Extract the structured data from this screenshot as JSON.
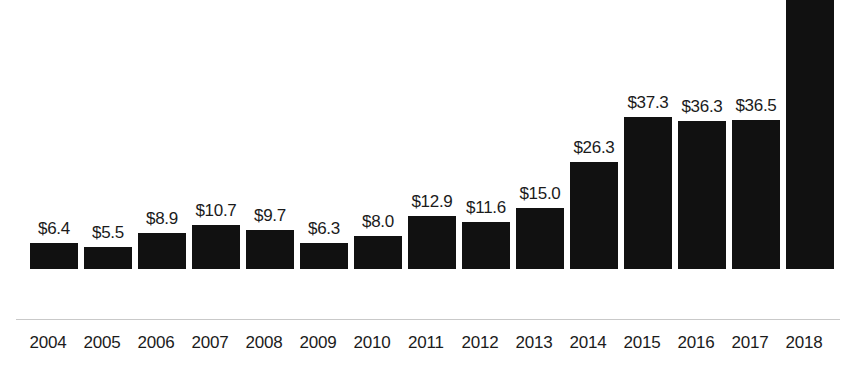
{
  "chart_data": {
    "type": "bar",
    "title": "",
    "subtitle": "",
    "xlabel": "",
    "ylabel": "",
    "categories": [
      "2004",
      "2005",
      "2006",
      "2007",
      "2008",
      "2009",
      "2010",
      "2011",
      "2012",
      "2013",
      "2014",
      "2015",
      "2016",
      "2017",
      "2018"
    ],
    "values": [
      6.4,
      5.5,
      8.9,
      10.7,
      9.7,
      6.3,
      8.0,
      12.9,
      11.6,
      15.0,
      26.3,
      37.3,
      36.3,
      36.5,
      66.8
    ],
    "data_labels": [
      "$6.4",
      "$5.5",
      "$8.9",
      "$10.7",
      "$9.7",
      "$6.3",
      "$8.0",
      "$12.9",
      "$11.6",
      "$15.0",
      "$26.3",
      "$37.3",
      "$36.3",
      "$36.5",
      "$66.8"
    ],
    "value_prefix": "$",
    "ylim": [
      0,
      66.8
    ],
    "grid": false,
    "legend": null,
    "legend_position": "none",
    "axis_line": true,
    "bar_color": "#111111",
    "background_color": "#ffffff",
    "label_color": "#1b1b1b",
    "axis_line_color": "#c9c9c9"
  }
}
